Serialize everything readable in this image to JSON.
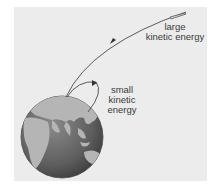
{
  "diagram": {
    "labels": {
      "large": [
        "large",
        "kinetic energy"
      ],
      "small": [
        "small",
        "kinetic",
        "energy"
      ]
    },
    "elements": {
      "earth": "globe showing Asia, Africa and Australia",
      "long_trajectory": "object launched with large kinetic energy escapes far from Earth",
      "short_trajectory": "object launched with small kinetic energy falls back to Earth",
      "projectile": "rocket/projectile at end of long trajectory"
    },
    "colors": {
      "background": "#ececec",
      "ocean": "#6e6e6e",
      "land": "#b8b8b8",
      "line": "#4a4a4a",
      "text": "#3a3a3a"
    }
  }
}
